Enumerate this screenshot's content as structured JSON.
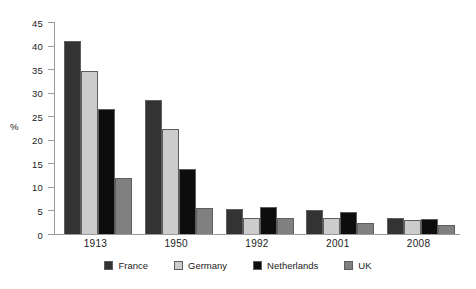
{
  "chart_data": {
    "type": "bar",
    "title": "",
    "xlabel": "",
    "ylabel": "%",
    "ylim": [
      0,
      45
    ],
    "yticks": [
      0,
      5,
      10,
      15,
      20,
      25,
      30,
      35,
      40,
      45
    ],
    "grid": false,
    "legend_position": "bottom",
    "categories": [
      "1913",
      "1950",
      "1992",
      "2001",
      "2008"
    ],
    "series": [
      {
        "name": "France",
        "color": "#333333",
        "values": [
          41.0,
          28.5,
          5.3,
          5.2,
          3.5
        ]
      },
      {
        "name": "Germany",
        "color": "#cccccc",
        "values": [
          34.7,
          22.3,
          3.4,
          3.3,
          2.9
        ]
      },
      {
        "name": "Netherlands",
        "color": "#0d0d0d",
        "values": [
          26.5,
          13.8,
          5.8,
          4.6,
          3.2
        ]
      },
      {
        "name": "UK",
        "color": "#808080",
        "values": [
          11.8,
          5.5,
          3.4,
          2.4,
          2.0
        ]
      }
    ]
  },
  "legend": {
    "items": [
      {
        "label": "France",
        "swatch": "#333333"
      },
      {
        "label": "Germany",
        "swatch": "#cccccc"
      },
      {
        "label": "Netherlands",
        "swatch": "#0d0d0d"
      },
      {
        "label": "UK",
        "swatch": "#808080"
      }
    ]
  },
  "axis": {
    "y_title": "%",
    "y_tick_labels": [
      "0",
      "5",
      "10",
      "15",
      "20",
      "25",
      "30",
      "35",
      "40",
      "45"
    ],
    "x_tick_labels": [
      "1913",
      "1950",
      "1992",
      "2001",
      "2008"
    ]
  }
}
